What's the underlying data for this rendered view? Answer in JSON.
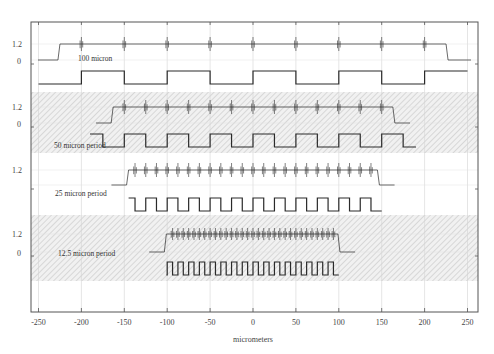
{
  "chart_data": {
    "type": "line",
    "title": "",
    "xlabel": "micrometers",
    "ylabel": "",
    "xlim": [
      -260,
      260
    ],
    "x_ticks": [
      -250,
      -200,
      -150,
      -100,
      -50,
      0,
      50,
      100,
      150,
      200,
      250
    ],
    "x_tick_labels": [
      "-250",
      "-200",
      "-150",
      "-100",
      "-50",
      "0",
      "50",
      "100",
      "150",
      "200",
      "250"
    ],
    "y_tick_labels": [
      "1.2",
      "0"
    ],
    "grid": true,
    "legend": null,
    "panels": [
      {
        "name": "100 micron",
        "label": "100 micron",
        "period_um": 100,
        "signal_extent_um": [
          -225,
          225
        ],
        "square_extent_um": [
          -250,
          250
        ],
        "baseline_value": 0,
        "active_value": 1.2,
        "shaded": false
      },
      {
        "name": "50 micron period",
        "label": "50 micron period",
        "period_um": 50,
        "signal_extent_um": [
          -163,
          163
        ],
        "square_extent_um": [
          -190,
          190
        ],
        "baseline_value": 0,
        "active_value": 1.2,
        "shaded": true
      },
      {
        "name": "25 micron period",
        "label": "25 micron period",
        "period_um": 25,
        "signal_extent_um": [
          -145,
          145
        ],
        "square_extent_um": [
          -145,
          150
        ],
        "baseline_value": 0,
        "active_value": 1.2,
        "shaded": false
      },
      {
        "name": "12.5 micron period",
        "label": "12.5 micron period",
        "period_um": 12.5,
        "signal_extent_um": [
          -101,
          99
        ],
        "square_extent_um": [
          -101,
          100
        ],
        "baseline_value": 0,
        "active_value": 1.2,
        "shaded": true
      }
    ]
  },
  "axis": {
    "x_title": "micrometers",
    "y_labels": {
      "high": "1.2",
      "zero": "0"
    }
  },
  "colors": {
    "trace": "#2a2a2a",
    "grid": "#d4d4d4",
    "frame": "#555555",
    "hatch": "#c8c8c8"
  }
}
